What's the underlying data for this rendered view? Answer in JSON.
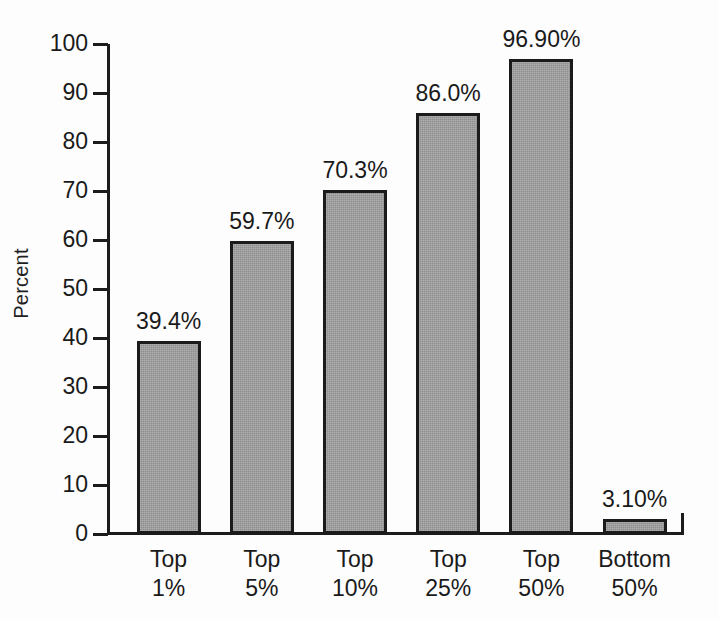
{
  "chart_data": {
    "type": "bar",
    "title": "",
    "xlabel": "",
    "ylabel": "Percent",
    "ylim": [
      0,
      100
    ],
    "grid": false,
    "legend": false,
    "orientation": "vertical",
    "categories": [
      "Top 1%",
      "Top 5%",
      "Top 10%",
      "Top 25%",
      "Top 50%",
      "Bottom 50%"
    ],
    "category_lines": [
      {
        "line1": "Top",
        "line2": "1%"
      },
      {
        "line1": "Top",
        "line2": "5%"
      },
      {
        "line1": "Top",
        "line2": "10%"
      },
      {
        "line1": "Top",
        "line2": "25%"
      },
      {
        "line1": "Top",
        "line2": "50%"
      },
      {
        "line1": "Bottom",
        "line2": "50%"
      }
    ],
    "values": [
      39.4,
      59.7,
      70.3,
      86.0,
      96.9,
      3.1
    ],
    "value_labels": [
      "39.4%",
      "59.7%",
      "70.3%",
      "86.0%",
      "96.90%",
      "3.10%"
    ],
    "y_ticks": [
      0,
      10,
      20,
      30,
      40,
      50,
      60,
      70,
      80,
      90,
      100
    ],
    "y_tick_labels": [
      "0",
      "10",
      "20",
      "30",
      "40",
      "50",
      "60",
      "70",
      "80",
      "90",
      "100"
    ],
    "colors": {
      "bar_fill": "#9b9b9b",
      "bar_border": "#1b1b1b",
      "axis": "#1c1c1c",
      "text": "#1a1a1a",
      "background": "#fdfdfd"
    }
  },
  "axis": {
    "y_title": "Percent"
  }
}
